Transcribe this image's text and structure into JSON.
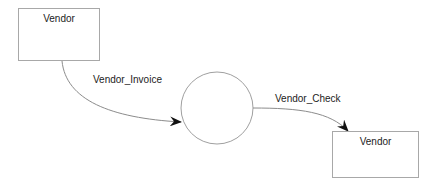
{
  "diagram": {
    "type": "data-flow-diagram",
    "entities": [
      {
        "id": "vendor_source",
        "label": "Vendor"
      },
      {
        "id": "vendor_sink",
        "label": "Vendor"
      }
    ],
    "process": {
      "label": ""
    },
    "flows": [
      {
        "from": "vendor_source",
        "to": "process",
        "label": "Vendor_Invoice"
      },
      {
        "from": "process",
        "to": "vendor_sink",
        "label": "Vendor_Check"
      }
    ]
  },
  "colors": {
    "line": "#8c8c8c",
    "arrowhead": "#111111",
    "text": "#222222",
    "border": "#a8a8a8"
  }
}
